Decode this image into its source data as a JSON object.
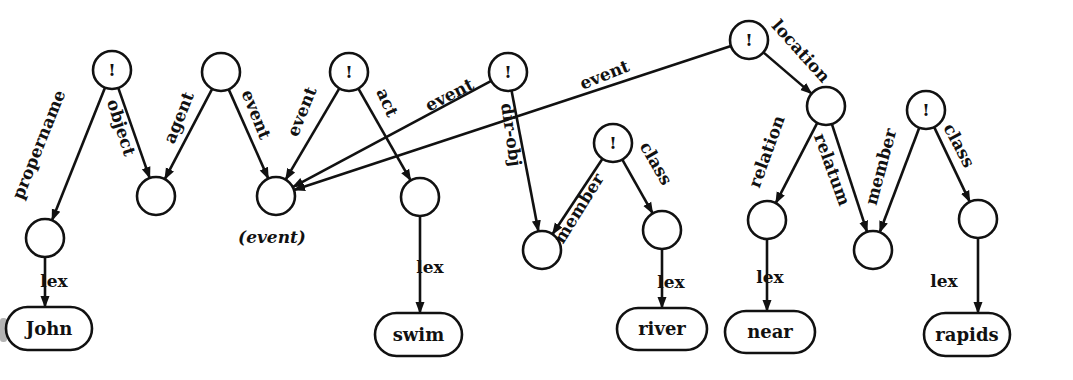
{
  "diagram": {
    "colors": {
      "ink": "#111111",
      "background": "#ffffff"
    },
    "nodes": [
      {
        "id": "n1",
        "x": 112,
        "y": 70,
        "mark": "!"
      },
      {
        "id": "n2",
        "x": 221,
        "y": 72,
        "mark": ""
      },
      {
        "id": "n3",
        "x": 349,
        "y": 72,
        "mark": "!"
      },
      {
        "id": "n4",
        "x": 508,
        "y": 72,
        "mark": "!"
      },
      {
        "id": "n5",
        "x": 749,
        "y": 40,
        "mark": "!"
      },
      {
        "id": "n6",
        "x": 45,
        "y": 238,
        "mark": ""
      },
      {
        "id": "n7",
        "x": 156,
        "y": 196,
        "mark": ""
      },
      {
        "id": "n8",
        "x": 276,
        "y": 196,
        "mark": "",
        "caption": "(event)"
      },
      {
        "id": "n9",
        "x": 420,
        "y": 197,
        "mark": ""
      },
      {
        "id": "n10",
        "x": 613,
        "y": 143,
        "mark": "!"
      },
      {
        "id": "n11",
        "x": 542,
        "y": 250,
        "mark": ""
      },
      {
        "id": "n12",
        "x": 662,
        "y": 230,
        "mark": ""
      },
      {
        "id": "n13",
        "x": 826,
        "y": 106,
        "mark": ""
      },
      {
        "id": "n14",
        "x": 767,
        "y": 220,
        "mark": ""
      },
      {
        "id": "n15",
        "x": 873,
        "y": 250,
        "mark": ""
      },
      {
        "id": "n16",
        "x": 926,
        "y": 110,
        "mark": "!"
      },
      {
        "id": "n17",
        "x": 978,
        "y": 219,
        "mark": ""
      }
    ],
    "lex_boxes": [
      {
        "id": "john",
        "label": "John",
        "x": 6,
        "y": 307,
        "w": 86,
        "h": 43
      },
      {
        "id": "swim",
        "label": "swim",
        "x": 375,
        "y": 313,
        "w": 87,
        "h": 43
      },
      {
        "id": "river",
        "label": "river",
        "x": 617,
        "y": 308,
        "w": 90,
        "h": 42
      },
      {
        "id": "near",
        "label": "near",
        "x": 725,
        "y": 311,
        "w": 90,
        "h": 42
      },
      {
        "id": "rapids",
        "label": "rapids",
        "x": 924,
        "y": 313,
        "w": 86,
        "h": 43
      }
    ],
    "edges": [
      {
        "from": "n1",
        "to": "n6",
        "label": "propername",
        "lx": 40,
        "ly": 145,
        "angle": -68
      },
      {
        "from": "n1",
        "to": "n7",
        "label": "object",
        "lx": 120,
        "ly": 128,
        "angle": 72
      },
      {
        "from": "n2",
        "to": "n7",
        "label": "agent",
        "lx": 180,
        "ly": 118,
        "angle": -68
      },
      {
        "from": "n2",
        "to": "n8",
        "label": "event",
        "lx": 255,
        "ly": 115,
        "angle": 68
      },
      {
        "from": "n3",
        "to": "n8",
        "label": "event",
        "lx": 303,
        "ly": 112,
        "angle": -68
      },
      {
        "from": "n3",
        "to": "n9",
        "label": "act",
        "lx": 386,
        "ly": 103,
        "angle": 66
      },
      {
        "from": "n4",
        "to": "n8",
        "label": "event",
        "lx": 450,
        "ly": 96,
        "angle": -27
      },
      {
        "from": "n5",
        "to": "n8",
        "label": "event",
        "lx": 605,
        "ly": 76,
        "angle": -22
      },
      {
        "from": "n4",
        "to": "n11",
        "label": "dir-obj",
        "lx": 510,
        "ly": 135,
        "angle": 82
      },
      {
        "from": "n5",
        "to": "n13",
        "label": "location",
        "lx": 800,
        "ly": 52,
        "angle": 48
      },
      {
        "from": "n10",
        "to": "n11",
        "label": "member",
        "lx": 580,
        "ly": 209,
        "angle": -58
      },
      {
        "from": "n10",
        "to": "n12",
        "label": "class",
        "lx": 655,
        "ly": 164,
        "angle": 60
      },
      {
        "from": "n13",
        "to": "n14",
        "label": "relation",
        "lx": 768,
        "ly": 152,
        "angle": -70
      },
      {
        "from": "n13",
        "to": "n15",
        "label": "relatum",
        "lx": 831,
        "ly": 170,
        "angle": 70
      },
      {
        "from": "n16",
        "to": "n15",
        "label": "member",
        "lx": 882,
        "ly": 167,
        "angle": -75
      },
      {
        "from": "n16",
        "to": "n17",
        "label": "class",
        "lx": 958,
        "ly": 146,
        "angle": 62
      },
      {
        "from": "n6",
        "to": "john",
        "label": "lex",
        "lx": 54,
        "ly": 282,
        "angle": 0
      },
      {
        "from": "n9",
        "to": "swim",
        "label": "lex",
        "lx": 430,
        "ly": 268,
        "angle": 0
      },
      {
        "from": "n12",
        "to": "river",
        "label": "lex",
        "lx": 671,
        "ly": 283,
        "angle": 0
      },
      {
        "from": "n14",
        "to": "near",
        "label": "lex",
        "lx": 770,
        "ly": 278,
        "angle": 0
      },
      {
        "from": "n17",
        "to": "rapids",
        "label": "lex",
        "lx": 944,
        "ly": 282,
        "angle": 0
      }
    ],
    "node_radius": 19
  }
}
